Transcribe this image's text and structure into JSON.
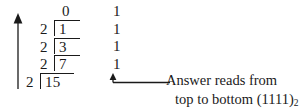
{
  "figure": {
    "type": "successive-division-binary-conversion",
    "arrow_left": "up-arrow",
    "quotient_top": "0",
    "rows": [
      {
        "divisor": "2",
        "dividend": "1",
        "remainder": "1"
      },
      {
        "divisor": "2",
        "dividend": "3",
        "remainder": "1"
      },
      {
        "divisor": "2",
        "dividend": "7",
        "remainder": "1"
      },
      {
        "divisor": "2",
        "dividend": "15",
        "remainder": "1"
      }
    ],
    "caption_line1": "Answer reads from",
    "caption_line2_prefix": "top to bottom (1111)",
    "caption_subscript": "2",
    "ink_color": "#1a1a1a",
    "background_color": "#ffffff"
  }
}
